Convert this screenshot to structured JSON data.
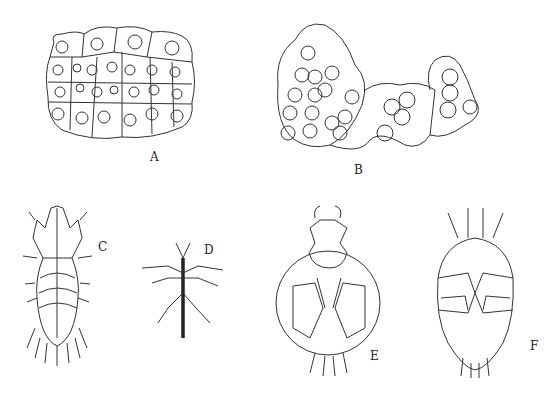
{
  "figure": {
    "panels": [
      {
        "id": "A",
        "label": "A",
        "subject": "epithelial cell cluster with nuclei"
      },
      {
        "id": "B",
        "label": "B",
        "subject": "cell aggregates containing spherical bodies"
      },
      {
        "id": "C",
        "label": "C",
        "subject": "mite dorsal view, elongate body with setae"
      },
      {
        "id": "D",
        "label": "D",
        "subject": "slender stick-like insect"
      },
      {
        "id": "E",
        "label": "E",
        "subject": "round-bodied mite ventral view"
      },
      {
        "id": "F",
        "label": "F",
        "subject": "oval mite ventral view with leg plates"
      }
    ]
  }
}
